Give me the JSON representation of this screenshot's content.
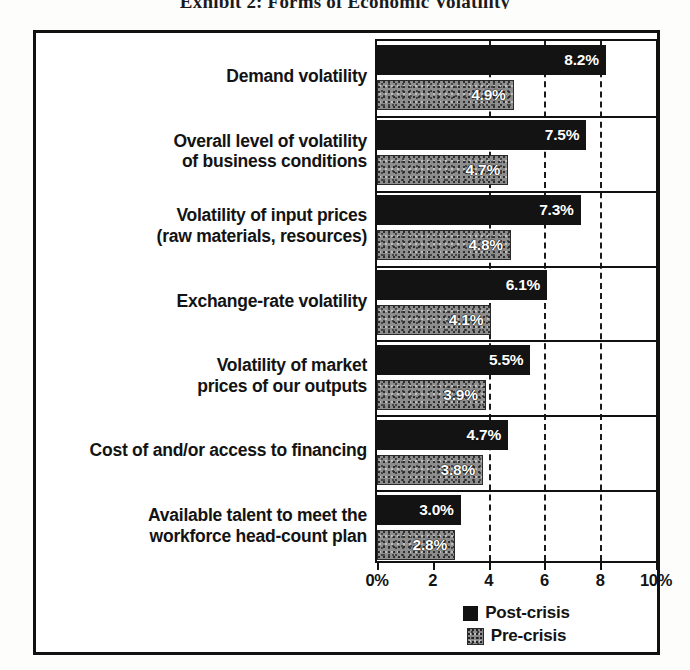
{
  "title": "Exhibit 2: Forms of Economic Volatility",
  "chart_data": {
    "type": "bar",
    "title": "Exhibit 2: Forms of Economic Volatility",
    "xlabel": "",
    "ylabel": "",
    "orientation": "horizontal",
    "xlim": [
      0,
      10
    ],
    "xticks": [
      0,
      2,
      4,
      6,
      8,
      10
    ],
    "xtick_labels": [
      "0%",
      "2",
      "4",
      "6",
      "8",
      "10%"
    ],
    "grid": "vertical dashed gridlines at 4, 6, 8",
    "legend_position": "bottom-center",
    "categories": [
      "Demand volatility",
      "Overall level of volatility\nof business conditions",
      "Volatility of input prices\n(raw materials, resources)",
      "Exchange-rate volatility",
      "Volatility of market\nprices of our outputs",
      "Cost of and/or access to financing",
      "Available talent to meet the\nworkforce head-count plan"
    ],
    "series": [
      {
        "name": "Post-crisis",
        "color": "#131313",
        "values": [
          8.2,
          7.5,
          7.3,
          6.1,
          5.5,
          4.7,
          3.0
        ],
        "labels": [
          "8.2%",
          "7.5%",
          "7.3%",
          "6.1%",
          "5.5%",
          "4.7%",
          "3.0%"
        ]
      },
      {
        "name": "Pre-crisis",
        "color": "#8d8d8d",
        "values": [
          4.9,
          4.7,
          4.8,
          4.1,
          3.9,
          3.8,
          2.8
        ],
        "labels": [
          "4.9%",
          "4.7%",
          "4.8%",
          "4.1%",
          "3.9%",
          "3.8%",
          "2.8%"
        ]
      }
    ]
  },
  "legend": [
    {
      "label": "Post-crisis",
      "swatch": "black-square-icon"
    },
    {
      "label": "Pre-crisis",
      "swatch": "stippled-square-icon"
    }
  ]
}
